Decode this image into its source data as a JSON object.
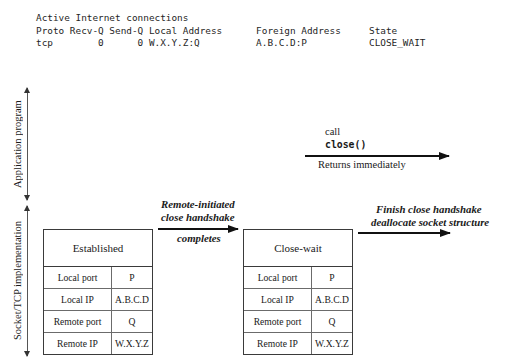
{
  "netstat": {
    "lines": [
      "Active Internet connections",
      "Proto Recv-Q Send-Q Local Address      Foreign Address     State",
      "tcp        0      0 W.X.Y.Z:Q          A.B.C.D:P           CLOSE_WAIT"
    ],
    "text": "Active Internet connections\nProto Recv-Q Send-Q Local Address      Foreign Address     State\ntcp        0      0 W.X.Y.Z:Q          A.B.C.D:P           CLOSE_WAIT"
  },
  "layers": {
    "application": "Application program",
    "socket_tcp": "Socket/TCP implementation"
  },
  "annotations": {
    "call": "call",
    "close_call": "close()",
    "returns": "Returns immediately",
    "remote_initiated_line1": "Remote-initiated",
    "remote_initiated_line2": "close handshake",
    "completes": "completes",
    "finish_line1": "Finish close handshake",
    "finish_line2": "deallocate socket structure"
  },
  "tables": [
    {
      "title": "Established",
      "rows": [
        {
          "key": "Local port",
          "value": "P"
        },
        {
          "key": "Local IP",
          "value": "A.B.C.D"
        },
        {
          "key": "Remote port",
          "value": "Q"
        },
        {
          "key": "Remote IP",
          "value": "W.X.Y.Z"
        }
      ]
    },
    {
      "title": "Close-wait",
      "rows": [
        {
          "key": "Local port",
          "value": "P"
        },
        {
          "key": "Local IP",
          "value": "A.B.C.D"
        },
        {
          "key": "Remote port",
          "value": "Q"
        },
        {
          "key": "Remote IP",
          "value": "W.X.Y.Z"
        }
      ]
    }
  ],
  "colors": {
    "background": "#ffffff",
    "text": "#1a1a1a",
    "arrow": "#111111",
    "box_border": "#3a3a3a",
    "inner_border": "#6b6b6b"
  }
}
